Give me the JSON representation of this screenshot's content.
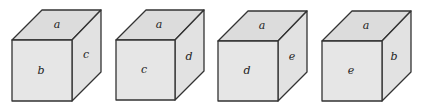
{
  "diagram": {
    "cubes": [
      {
        "top": "a",
        "front": "b",
        "right": "c"
      },
      {
        "top": "a",
        "front": "c",
        "right": "d"
      },
      {
        "top": "a",
        "front": "d",
        "right": "e"
      },
      {
        "top": "a",
        "front": "e",
        "right": "b"
      }
    ]
  }
}
